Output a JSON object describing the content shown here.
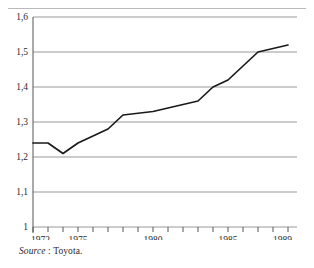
{
  "figure": {
    "source_prefix": "Source",
    "source_separator": " : ",
    "source_value": "Toyota."
  },
  "chart_data": {
    "type": "line",
    "title": "",
    "subtitle": "",
    "xlabel": "",
    "ylabel": "",
    "x": [
      1972,
      1973,
      1974,
      1975,
      1976,
      1977,
      1978,
      1979,
      1980,
      1981,
      1982,
      1983,
      1984,
      1985,
      1986,
      1987,
      1988,
      1989
    ],
    "values": [
      1.24,
      1.24,
      1.21,
      1.24,
      1.26,
      1.28,
      1.32,
      1.325,
      1.33,
      1.34,
      1.35,
      1.36,
      1.4,
      1.42,
      1.46,
      1.5,
      1.51,
      1.52
    ],
    "series": [
      {
        "name": "",
        "values": [
          1.24,
          1.24,
          1.21,
          1.24,
          1.26,
          1.28,
          1.32,
          1.325,
          1.33,
          1.34,
          1.35,
          1.36,
          1.4,
          1.42,
          1.46,
          1.5,
          1.51,
          1.52
        ]
      }
    ],
    "xlim": [
      1972,
      1989
    ],
    "ylim": [
      1.0,
      1.6
    ],
    "ytick_values": [
      1.6,
      1.5,
      1.4,
      1.3,
      1.2,
      1.1,
      1.0
    ],
    "ytick_labels": [
      "1,6",
      "1,5",
      "1,4",
      "1,3",
      "1,2",
      "1,1",
      "1"
    ],
    "xtick_values": [
      1972,
      1973,
      1974,
      1975,
      1976,
      1977,
      1978,
      1979,
      1980,
      1981,
      1982,
      1983,
      1984,
      1985,
      1986,
      1987,
      1988,
      1989
    ],
    "xtick_labels_shown": [
      {
        "value": 1972,
        "label": "1972"
      },
      {
        "value": 1975,
        "label": "1975"
      },
      {
        "value": 1980,
        "label": "1980"
      },
      {
        "value": 1985,
        "label": "1985"
      },
      {
        "value": 1989,
        "label": "1989"
      }
    ],
    "grid": true,
    "grid_axis": "y",
    "legend": null,
    "line_color": "#1a1a1a",
    "grid_color": "#999999",
    "axis_color": "#555555"
  }
}
